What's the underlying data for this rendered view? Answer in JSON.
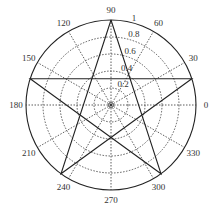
{
  "chart_data": {
    "type": "polar-line",
    "title": "",
    "shape": "pentagram",
    "angle_ticks": [
      "0",
      "30",
      "60",
      "90",
      "120",
      "150",
      "180",
      "210",
      "240",
      "270",
      "300",
      "330"
    ],
    "radial_ticks": [
      "0.2",
      "0.4",
      "0.6",
      "0.8",
      "1"
    ],
    "rlim": [
      0,
      1
    ],
    "grid": true,
    "series": [
      {
        "name": "pentagram",
        "theta_deg": [
          90,
          234,
          18,
          162,
          306,
          90
        ],
        "r": [
          1,
          1,
          1,
          1,
          1,
          1
        ]
      }
    ]
  },
  "colors": {
    "line": "#222222",
    "grid": "#333333",
    "background": "#ffffff"
  }
}
